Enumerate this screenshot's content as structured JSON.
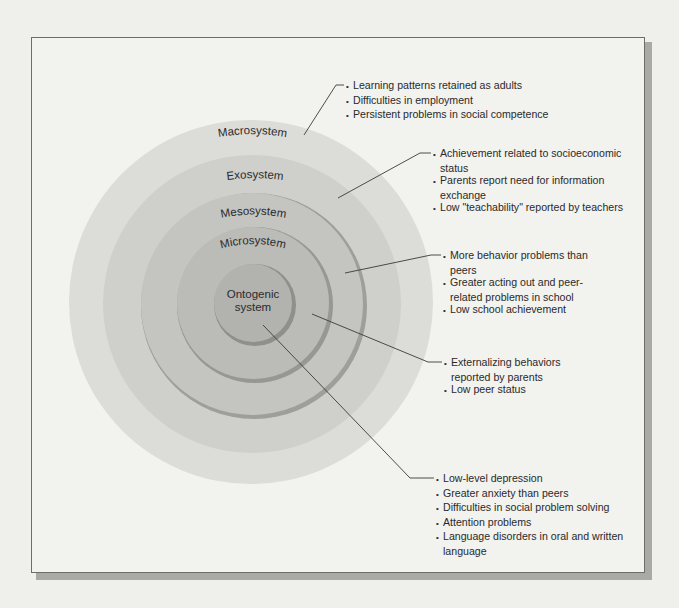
{
  "diagram": {
    "type": "concentric-systems",
    "colors": {
      "background": "#efefec",
      "frame_fill": "#f2f2ef",
      "frame_border": "#6d6d6b",
      "macrosystem": "#dcdcd9",
      "exosystem": "#cfcfcc",
      "mesosystem": "#c4c4c1",
      "microsystem": "#bbbbb8",
      "ontogenic": "#b2b2af",
      "leader_line": "#3a3a3a"
    },
    "rings": [
      {
        "id": "macrosystem",
        "label": "Macrosystem"
      },
      {
        "id": "exosystem",
        "label": "Exosystem"
      },
      {
        "id": "mesosystem",
        "label": "Mesosystem"
      },
      {
        "id": "microsystem",
        "label": "Microsystem"
      },
      {
        "id": "ontogenic",
        "label_line1": "Ontogenic",
        "label_line2": "system"
      }
    ],
    "callouts": [
      {
        "ring": "macrosystem",
        "items": [
          "Learning patterns retained as adults",
          "Difficulties in employment",
          "Persistent problems in social competence"
        ]
      },
      {
        "ring": "exosystem",
        "items": [
          "Achievement related to socioeconomic status",
          "Parents report need for information exchange",
          "Low \"teachability\" reported by teachers"
        ]
      },
      {
        "ring": "mesosystem",
        "items": [
          "More behavior problems than peers",
          "Greater acting out and peer-related problems in school",
          "Low school achievement"
        ]
      },
      {
        "ring": "microsystem",
        "items": [
          "Externalizing behaviors reported by parents",
          "Low peer status"
        ]
      },
      {
        "ring": "ontogenic",
        "items": [
          "Low-level depression",
          "Greater anxiety than peers",
          "Difficulties in social problem solving",
          "Attention problems",
          "Language disorders in oral and written language"
        ]
      }
    ]
  }
}
